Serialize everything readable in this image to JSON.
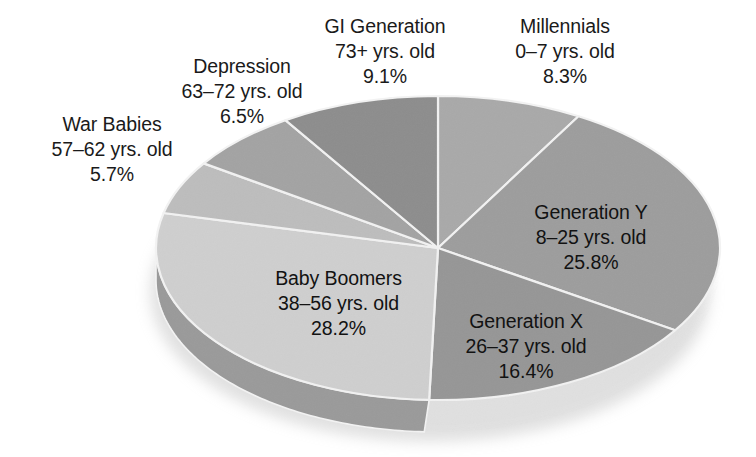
{
  "chart_data": {
    "type": "pie",
    "title": "",
    "subtitle": "",
    "style": "3d-exploded-depth",
    "legend_position": "none",
    "start_angle_deg": 0,
    "direction": "clockwise",
    "categories": [
      "Millennials",
      "Generation Y",
      "Generation X",
      "Baby Boomers",
      "War Babies",
      "Depression",
      "GI Generation"
    ],
    "values": [
      8.3,
      25.8,
      16.4,
      28.2,
      5.7,
      6.5,
      9.1
    ],
    "value_unit": "%",
    "slices": [
      {
        "name": "Millennials",
        "age_range": "0–7 yrs. old",
        "percent": "8.3%",
        "value": 8.3,
        "color": "#a9a9a9",
        "side_color": "#8f8f8f",
        "label_placement": "callout-outside-top-right"
      },
      {
        "name": "Generation Y",
        "age_range": "8–25 yrs. old",
        "percent": "25.8%",
        "value": 25.8,
        "color": "#9d9d9d",
        "side_color": "#848484",
        "label_placement": "inside-right"
      },
      {
        "name": "Generation X",
        "age_range": "26–37 yrs. old",
        "percent": "16.4%",
        "value": 16.4,
        "color": "#969696",
        "side_color": "#6f6f6f",
        "label_placement": "inside-bottom-right"
      },
      {
        "name": "Baby Boomers",
        "age_range": "38–56 yrs. old",
        "percent": "28.2%",
        "value": 28.2,
        "color": "#cfcfcf",
        "side_color": "#9a9a9a",
        "label_placement": "inside-bottom-left"
      },
      {
        "name": "War Babies",
        "age_range": "57–62 yrs. old",
        "percent": "5.7%",
        "value": 5.7,
        "color": "#bdbdbd",
        "side_color": "#9a9a9a",
        "label_placement": "callout-outside-left"
      },
      {
        "name": "Depression",
        "age_range": "63–72 yrs. old",
        "percent": "6.5%",
        "value": 6.5,
        "color": "#a3a3a3",
        "side_color": "#8b8b8b",
        "label_placement": "callout-outside-top-left"
      },
      {
        "name": "GI Generation",
        "age_range": "73+ yrs. old",
        "percent": "9.1%",
        "value": 9.1,
        "color": "#8d8d8d",
        "side_color": "#7a7a7a",
        "label_placement": "callout-outside-top"
      }
    ],
    "colors": {
      "background": "#ffffff",
      "text": "#1a1a1a",
      "slice_divider": "#f2f2f2"
    }
  },
  "geometry": {
    "cx": 438,
    "cy": 248,
    "rx": 282,
    "ry": 152,
    "depth": 32
  }
}
